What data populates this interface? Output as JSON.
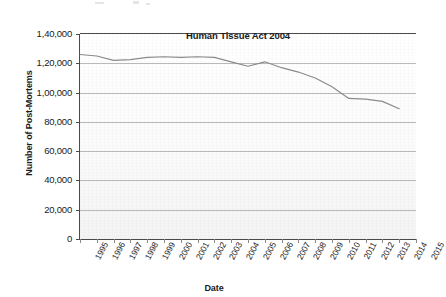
{
  "chart_data": {
    "type": "line",
    "title": "",
    "xlabel": "Date",
    "ylabel": "Number of Post-Mortems",
    "categories": [
      "1995",
      "1996",
      "1997",
      "1998",
      "1999",
      "2000",
      "2001",
      "2002",
      "2003",
      "2004",
      "2005",
      "2006",
      "2007",
      "2008",
      "2009",
      "2010",
      "2011",
      "2012",
      "2013",
      "2014",
      "2015"
    ],
    "series": [
      {
        "name": "Number of Post-Mortems",
        "values": [
          126000,
          125000,
          122000,
          122500,
          124000,
          124500,
          124000,
          124500,
          124000,
          121000,
          118000,
          121000,
          117000,
          114000,
          110000,
          104000,
          96000,
          95500,
          94000,
          89000,
          null
        ]
      }
    ],
    "ylim": [
      0,
      140000
    ],
    "yticks": [
      0,
      20000,
      40000,
      60000,
      80000,
      100000,
      120000,
      140000
    ],
    "ytick_labels": [
      "0",
      "20,000",
      "40,000",
      "60,000",
      "80,000",
      "1,00,000",
      "1,20,000",
      "1,40,000"
    ],
    "grid": true,
    "legend": "none",
    "line_color": "#8a8a8a",
    "annotations": [
      {
        "text": "Human Tissue Act 2004",
        "x": "2004",
        "y": 134000
      }
    ]
  }
}
